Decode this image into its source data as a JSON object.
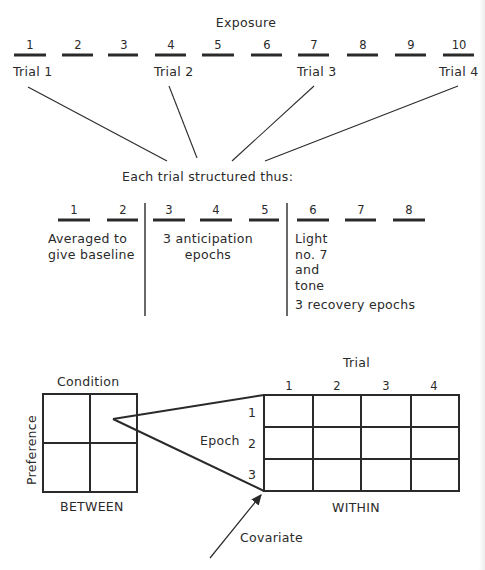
{
  "exposure": {
    "title": "Exposure",
    "numbers": [
      "1",
      "2",
      "3",
      "4",
      "5",
      "6",
      "7",
      "8",
      "9",
      "10"
    ],
    "trials": [
      "Trial 1",
      "Trial 2",
      "Trial 3",
      "Trial 4"
    ]
  },
  "structure": {
    "caption": "Each trial structured thus:",
    "epochs": [
      "1",
      "2",
      "3",
      "4",
      "5",
      "6",
      "7",
      "8"
    ],
    "baseline_label": [
      "Averaged to",
      "give baseline"
    ],
    "anticipation_label": [
      "3 anticipation",
      "epochs"
    ],
    "stimulus_label": [
      "Light",
      "no. 7",
      "and",
      "tone"
    ],
    "recovery_label": "3 recovery epochs"
  },
  "design": {
    "between": {
      "column_factor": "Condition",
      "row_factor": "Preference",
      "label": "BETWEEN"
    },
    "within": {
      "column_factor": "Trial",
      "columns": [
        "1",
        "2",
        "3",
        "4"
      ],
      "row_factor": "Epoch",
      "rows": [
        "1",
        "2",
        "3"
      ],
      "label": "WITHIN"
    },
    "covariate_label": "Covariate"
  },
  "colors": {
    "ink": "#2a2a2a",
    "background": "#ffffff"
  }
}
